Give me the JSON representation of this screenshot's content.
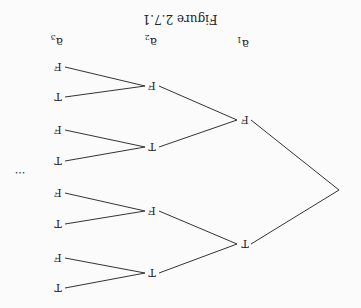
{
  "figure": {
    "title": "Figure 2.7.1",
    "orientation": "rotated 180 degrees",
    "column_labels": [
      {
        "id": "a1",
        "text": "a",
        "sub": "1"
      },
      {
        "id": "a2",
        "text": "a",
        "sub": "2"
      },
      {
        "id": "a3",
        "text": "a",
        "sub": "3"
      }
    ],
    "ellipsis": "...",
    "tree": {
      "level1": [
        "T",
        "F"
      ],
      "level2": [
        "T",
        "F",
        "T",
        "F"
      ],
      "level3": [
        "T",
        "F",
        "T",
        "F",
        "T",
        "F",
        "T",
        "F"
      ]
    }
  }
}
